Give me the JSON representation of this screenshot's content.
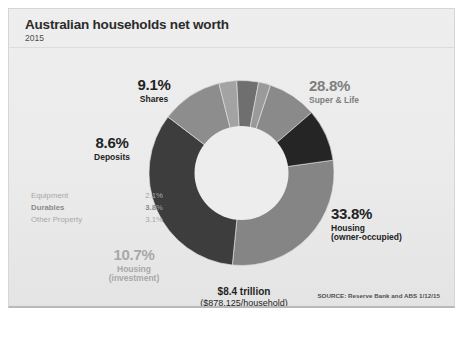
{
  "header": {
    "title": "Australian households net worth",
    "subtitle": "2015"
  },
  "center": {
    "total": "$8.4 trillion",
    "per_household": "($878,125/household)"
  },
  "source": "SOURCE: Reserve Bank and ABS 1/12/15",
  "callouts": {
    "shares": {
      "pct": "9.1%",
      "label": "Shares"
    },
    "super": {
      "pct": "28.8%",
      "label": "Super & Life"
    },
    "deposits": {
      "pct": "8.6%",
      "label": "Deposits"
    },
    "housing_owner": {
      "pct": "33.8%",
      "label": "Housing",
      "sub": "(owner-occupied)"
    },
    "housing_invest": {
      "pct": "10.7%",
      "label": "Housing",
      "sub": "(investment)"
    }
  },
  "minor_items": [
    {
      "name": "Equipment",
      "value": "2.1%"
    },
    {
      "name": "Durables",
      "value": "3.8%"
    },
    {
      "name": "Other Property",
      "value": "3.1%"
    }
  ],
  "chart_data": {
    "type": "pie",
    "variant": "donut",
    "title": "Australian households net worth",
    "subtitle": "2015",
    "unit": "percent of total net worth",
    "total_label": "$8.4 trillion",
    "per_household_label": "($878,125/household)",
    "source": "SOURCE: Reserve Bank and ABS 1/12/15",
    "grid": false,
    "legend": "callout-labels-around-ring",
    "inner_radius_ratio": 0.52,
    "start_angle_deg": -8,
    "direction": "clockwise",
    "labels": [
      "Super & Life",
      "Housing (owner-occupied)",
      "Housing (investment)",
      "Other Property",
      "Durables",
      "Equipment",
      "Deposits",
      "Shares"
    ],
    "values": [
      28.8,
      33.8,
      10.7,
      3.1,
      3.8,
      2.1,
      8.6,
      9.1
    ],
    "colors": [
      "#858585",
      "#3d3d3d",
      "#8d8d8d",
      "#a3a3a3",
      "#6f6f6f",
      "#9a9a9a",
      "#8a8a8a",
      "#252525"
    ],
    "slices": [
      {
        "label": "Super & Life",
        "value": 28.8,
        "color": "#858585"
      },
      {
        "label": "Housing (owner-occupied)",
        "value": 33.8,
        "color": "#3d3d3d"
      },
      {
        "label": "Housing (investment)",
        "value": 10.7,
        "color": "#8d8d8d"
      },
      {
        "label": "Other Property",
        "value": 3.1,
        "color": "#a3a3a3"
      },
      {
        "label": "Durables",
        "value": 3.8,
        "color": "#6f6f6f"
      },
      {
        "label": "Equipment",
        "value": 2.1,
        "color": "#9a9a9a"
      },
      {
        "label": "Deposits",
        "value": 8.6,
        "color": "#8a8a8a"
      },
      {
        "label": "Shares",
        "value": 9.1,
        "color": "#252525"
      }
    ]
  },
  "colors": {
    "card_bg": "#ebebeb",
    "card_border": "#d6d6d6",
    "text_dark": "#232323",
    "text_mid": "#7e7e7e",
    "text_light": "#a8a8a8"
  }
}
